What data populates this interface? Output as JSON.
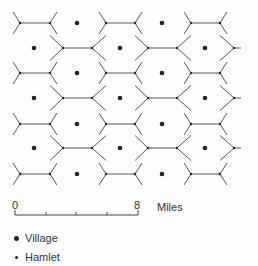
{
  "diagram": {
    "line_color": "#555555",
    "dot_color": "#222222",
    "grid": {
      "row_type_a_y": [
        23,
        73,
        124,
        174
      ],
      "row_type_b_y": [
        48,
        98,
        148
      ],
      "row_a_edges": [
        [
          20,
          50
        ],
        [
          106,
          135
        ],
        [
          191,
          220
        ]
      ],
      "row_b_edges": [
        [
          63,
          92
        ],
        [
          148,
          177
        ]
      ],
      "row_b_right_vertex_x": 234,
      "row_a_villages_x": [
        77,
        162
      ],
      "row_b_villages_x": [
        34,
        120,
        205
      ],
      "half_row_height": 12.5
    }
  },
  "scale_bar": {
    "start_label": "0",
    "end_label": "8",
    "unit_label": "Miles",
    "x_start": 15,
    "x_end": 138,
    "y": 215,
    "ticks_x": [
      46,
      76,
      107
    ]
  },
  "legend": {
    "items": [
      {
        "symbol": "large-dot",
        "label": "Village"
      },
      {
        "symbol": "small-dot",
        "label": "Hamlet"
      }
    ]
  }
}
